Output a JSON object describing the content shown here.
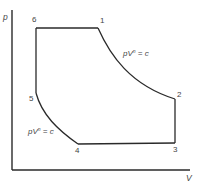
{
  "diagram": {
    "type": "p-V cycle diagram",
    "axes": {
      "y_label": "p",
      "x_label": "V"
    },
    "points": [
      {
        "id": "1",
        "label": "1"
      },
      {
        "id": "2",
        "label": "2"
      },
      {
        "id": "3",
        "label": "3"
      },
      {
        "id": "4",
        "label": "4"
      },
      {
        "id": "5",
        "label": "5"
      },
      {
        "id": "6",
        "label": "6"
      }
    ],
    "processes": [
      {
        "from": "6",
        "to": "1",
        "kind": "constant pressure"
      },
      {
        "from": "1",
        "to": "2",
        "kind": "polytropic expansion",
        "equation": {
          "base": "pV",
          "exponent": "n",
          "rhs": " = c"
        }
      },
      {
        "from": "2",
        "to": "3",
        "kind": "constant volume"
      },
      {
        "from": "3",
        "to": "4",
        "kind": "constant pressure"
      },
      {
        "from": "4",
        "to": "5",
        "kind": "polytropic compression",
        "equation": {
          "base": "pV",
          "exponent": "n",
          "rhs": " = c"
        }
      },
      {
        "from": "5",
        "to": "6",
        "kind": "constant volume"
      }
    ],
    "colors": {
      "line": "#2a2a2a",
      "text": "#444444",
      "background": "#ffffff"
    }
  }
}
